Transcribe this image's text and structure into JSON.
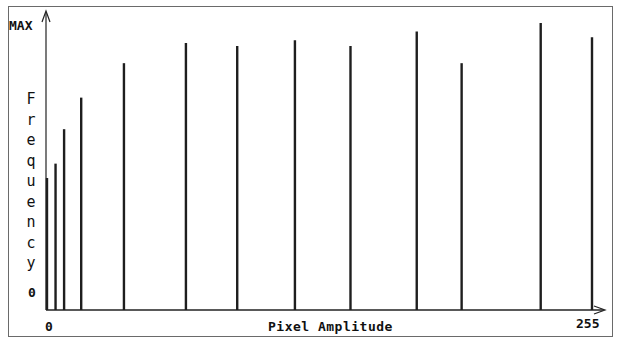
{
  "chart_data": {
    "type": "bar",
    "title": "",
    "xlabel": "Pixel Amplitude",
    "ylabel": "Frequency",
    "x_tick_labels": [
      "0",
      "255"
    ],
    "y_tick_labels": [
      "0",
      "MAX"
    ],
    "xlim": [
      0,
      255
    ],
    "ylim": [
      0,
      1
    ],
    "grid": false,
    "legend": null,
    "x": [
      0,
      4,
      8,
      16,
      36,
      65,
      89,
      116,
      142,
      173,
      194,
      231,
      255
    ],
    "values": [
      0.46,
      0.51,
      0.63,
      0.74,
      0.86,
      0.93,
      0.92,
      0.94,
      0.92,
      0.97,
      0.86,
      1.0,
      0.95
    ],
    "note": "Sparse histogram: vertical spikes at specific pixel amplitudes; heights relative to MAX"
  },
  "labels": {
    "y_max": "MAX",
    "y_zero": "0",
    "x_zero": "0",
    "x_max": "255",
    "x_axis_title": "Pixel Amplitude",
    "y_axis_title_letters": [
      "F",
      "r",
      "e",
      "q",
      "u",
      "e",
      "n",
      "c",
      "y"
    ]
  }
}
